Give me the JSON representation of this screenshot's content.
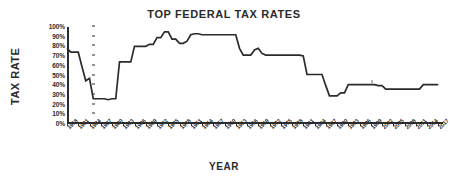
{
  "chart_data": {
    "type": "line",
    "title": "TOP FEDERAL TAX RATES",
    "xlabel": "YEAR",
    "ylabel": "TAX RATE",
    "ylim": [
      0,
      100
    ],
    "xlim": [
      1918,
      2018
    ],
    "grid": false,
    "legend": null,
    "ytick_labels": [
      "100%",
      "90%",
      "80%",
      "70%",
      "60%",
      "50%",
      "40%",
      "30%",
      "20%",
      "10%",
      "0%"
    ],
    "ytick_values": [
      100,
      90,
      80,
      70,
      60,
      50,
      40,
      30,
      20,
      10,
      0
    ],
    "xtick_labels": [
      "1918",
      "1921",
      "1924",
      "1927",
      "1930",
      "1933",
      "1936",
      "1939",
      "1942",
      "1945",
      "1948",
      "1951",
      "1954",
      "1957",
      "1960",
      "1963",
      "1966",
      "1969",
      "1972",
      "1975",
      "1978",
      "1981",
      "1984",
      "1987",
      "1990",
      "1993",
      "1996",
      "1999",
      "2002",
      "2005",
      "2008",
      "2011",
      "2014",
      "2017"
    ],
    "xtick_values": [
      1918,
      1921,
      1924,
      1927,
      1930,
      1933,
      1936,
      1939,
      1942,
      1945,
      1948,
      1951,
      1954,
      1957,
      1960,
      1963,
      1966,
      1969,
      1972,
      1975,
      1978,
      1981,
      1984,
      1987,
      1990,
      1993,
      1996,
      1999,
      2002,
      2005,
      2008,
      2011,
      2014,
      2017
    ],
    "series_name": "Top federal marginal tax rate",
    "x": [
      1918,
      1919,
      1920,
      1921,
      1922,
      1923,
      1924,
      1925,
      1926,
      1927,
      1928,
      1929,
      1930,
      1931,
      1932,
      1933,
      1934,
      1935,
      1936,
      1937,
      1938,
      1939,
      1940,
      1941,
      1942,
      1943,
      1944,
      1945,
      1946,
      1947,
      1948,
      1949,
      1950,
      1951,
      1952,
      1953,
      1954,
      1955,
      1956,
      1957,
      1958,
      1959,
      1960,
      1961,
      1962,
      1963,
      1964,
      1965,
      1966,
      1967,
      1968,
      1969,
      1970,
      1971,
      1972,
      1973,
      1974,
      1975,
      1976,
      1977,
      1978,
      1979,
      1980,
      1981,
      1982,
      1983,
      1984,
      1985,
      1986,
      1987,
      1988,
      1989,
      1990,
      1991,
      1992,
      1993,
      1994,
      1995,
      1996,
      1997,
      1998,
      1999,
      2000,
      2001,
      2002,
      2003,
      2004,
      2005,
      2006,
      2007,
      2008,
      2009,
      2010,
      2011,
      2012,
      2013,
      2014,
      2015,
      2016,
      2017
    ],
    "y": [
      77,
      73,
      73,
      73,
      58,
      43.5,
      46,
      25,
      25,
      25,
      25,
      24,
      25,
      25,
      63,
      63,
      63,
      63,
      79,
      79,
      79,
      79,
      81.1,
      81,
      88,
      88,
      94,
      94,
      86.45,
      86.45,
      82.13,
      82.13,
      84.36,
      91,
      92,
      92,
      91,
      91,
      91,
      91,
      91,
      91,
      91,
      91,
      91,
      91,
      77,
      70,
      70,
      70,
      75.25,
      77,
      71.75,
      70,
      70,
      70,
      70,
      70,
      70,
      70,
      70,
      70,
      70,
      69.125,
      50,
      50,
      50,
      50,
      50,
      38.5,
      28,
      28,
      28,
      31,
      31,
      39.6,
      39.6,
      39.6,
      39.6,
      39.6,
      39.6,
      39.6,
      39.6,
      38.6,
      38.6,
      35,
      35,
      35,
      35,
      35,
      35,
      35,
      35,
      35,
      35,
      39.6,
      39.6,
      39.6,
      39.6,
      39.6
    ],
    "units": "percent",
    "color": "#2b2b2b",
    "background": "#ffffff"
  }
}
